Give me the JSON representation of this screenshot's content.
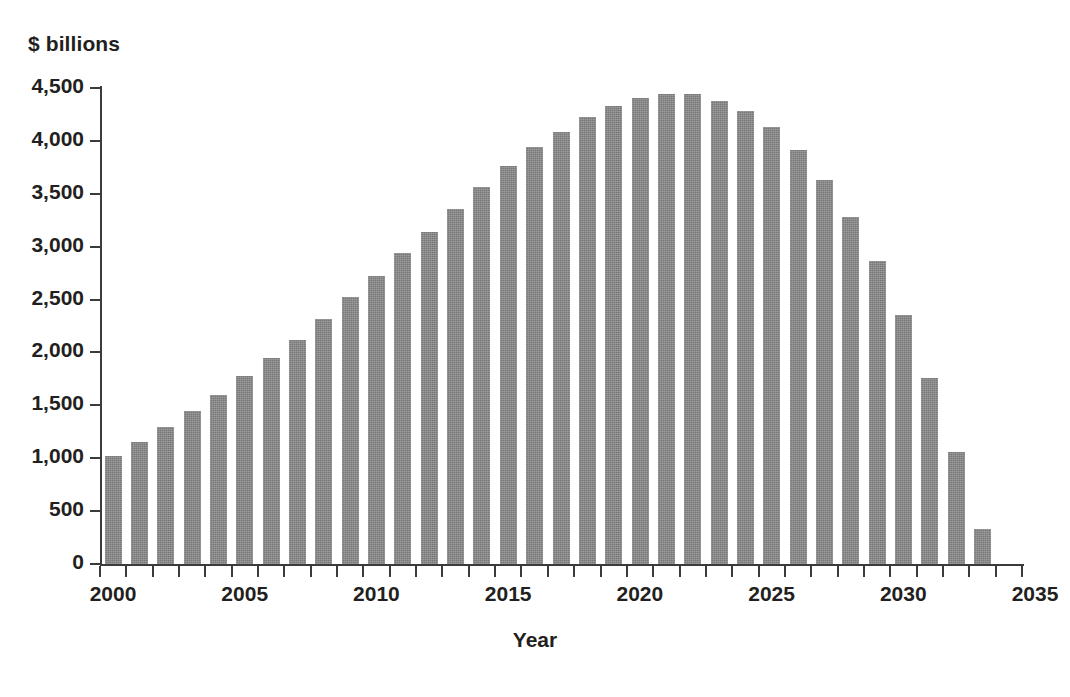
{
  "chart_data": {
    "type": "bar",
    "title": "",
    "subtitle": "",
    "unit_label": "$ billions",
    "xlabel": "Year",
    "ylabel": "$ billions",
    "ylim": [
      0,
      4500
    ],
    "xlim": [
      2000,
      2035
    ],
    "grid": false,
    "legend": null,
    "bar_color": "#878787",
    "axis_color": "#3b3b3b",
    "y_ticks": [
      0,
      500,
      1000,
      1500,
      2000,
      2500,
      3000,
      3500,
      4000,
      4500
    ],
    "y_tick_labels": [
      "0",
      "500",
      "1,000",
      "1,500",
      "2,000",
      "2,500",
      "3,000",
      "3,500",
      "4,000",
      "4,500"
    ],
    "x_ticks": [
      2000,
      2001,
      2002,
      2003,
      2004,
      2005,
      2006,
      2007,
      2008,
      2009,
      2010,
      2011,
      2012,
      2013,
      2014,
      2015,
      2016,
      2017,
      2018,
      2019,
      2020,
      2021,
      2022,
      2023,
      2024,
      2025,
      2026,
      2027,
      2028,
      2029,
      2030,
      2031,
      2032,
      2033,
      2034,
      2035
    ],
    "x_tick_labels_shown": [
      "2000",
      "2005",
      "2010",
      "2015",
      "2020",
      "2025",
      "2030",
      "2035"
    ],
    "categories": [
      2000,
      2001,
      2002,
      2003,
      2004,
      2005,
      2006,
      2007,
      2008,
      2009,
      2010,
      2011,
      2012,
      2013,
      2014,
      2015,
      2016,
      2017,
      2018,
      2019,
      2020,
      2021,
      2022,
      2023,
      2024,
      2025,
      2026,
      2027,
      2028,
      2029,
      2030,
      2031,
      2032,
      2033
    ],
    "values": [
      1020,
      1150,
      1300,
      1450,
      1600,
      1780,
      1950,
      2120,
      2320,
      2520,
      2720,
      2940,
      3140,
      3360,
      3560,
      3760,
      3940,
      4080,
      4230,
      4330,
      4410,
      4440,
      4440,
      4380,
      4280,
      4130,
      3910,
      3630,
      3280,
      2860,
      2350,
      1760,
      1060,
      330
    ]
  }
}
